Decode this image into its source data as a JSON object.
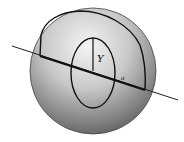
{
  "diagram": {
    "labels": {
      "segment": "Y",
      "point": "a"
    },
    "colors": {
      "line": "#111111",
      "sphere_light": "#f2f2f2",
      "sphere_dark": "#5a5a5a",
      "background": "#ffffff"
    }
  }
}
